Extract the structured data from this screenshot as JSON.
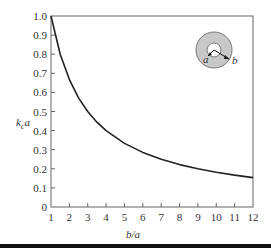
{
  "chart_data": {
    "type": "line",
    "title": "",
    "xlabel": "b/a",
    "ylabel": "k_c a",
    "ylabel_main": "k",
    "ylabel_sub": "c",
    "ylabel_tail": "a",
    "xlim": [
      1,
      12
    ],
    "ylim": [
      0,
      1.0
    ],
    "xticks": [
      1,
      2,
      3,
      4,
      5,
      6,
      7,
      8,
      9,
      10,
      11,
      12
    ],
    "yticks": [
      0,
      0.1,
      0.2,
      0.3,
      0.4,
      0.5,
      0.6,
      0.7,
      0.8,
      0.9,
      1.0
    ],
    "ytick_labels": [
      "0",
      "0.1",
      "0.2",
      "0.3",
      "0.4",
      "0.5",
      "0.6",
      "0.7",
      "0.8",
      "0.9",
      "1.0"
    ],
    "grid": false,
    "series": [
      {
        "name": "kc a vs b/a",
        "color": "#222222",
        "x": [
          1,
          1.5,
          2,
          2.5,
          3,
          3.5,
          4,
          5,
          6,
          7,
          8,
          9,
          10,
          11,
          12
        ],
        "y": [
          1.0,
          0.8,
          0.667,
          0.571,
          0.5,
          0.444,
          0.4,
          0.333,
          0.286,
          0.25,
          0.222,
          0.2,
          0.182,
          0.167,
          0.154
        ]
      }
    ],
    "inset": {
      "description": "coaxial cross-section",
      "inner_label": "a",
      "outer_label": "b",
      "fill_color": "#c8c8c8"
    }
  }
}
